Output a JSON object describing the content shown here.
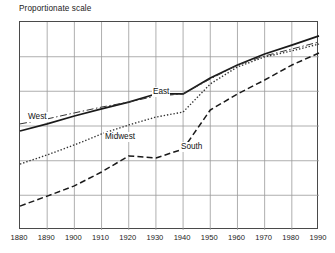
{
  "chart_data": {
    "type": "line",
    "title": "Proportionate scale",
    "xlabel": "",
    "ylabel": "",
    "grid": true,
    "legend_position": "inline-labels",
    "x_tick_labels": [
      "1880",
      "1890",
      "1900",
      "1910",
      "1920",
      "1930",
      "1940",
      "1950",
      "1960",
      "1970",
      "1980",
      "1990"
    ],
    "x": [
      1880,
      1890,
      1900,
      1910,
      1920,
      1930,
      1940,
      1950,
      1960,
      1970,
      1980,
      1990
    ],
    "xlim": [
      1880,
      1990
    ],
    "y_tick_labels": [],
    "ylim": [
      0,
      100
    ],
    "y_gridline_values": [
      100,
      83.3,
      66.7,
      50,
      33.3,
      16.7,
      0
    ],
    "series": [
      {
        "name": "East",
        "line_style": "solid",
        "color": "#1a1a1a",
        "values": [
          47.6,
          51.0,
          54.8,
          58.2,
          61.5,
          65.4,
          65.4,
          73.1,
          79.3,
          84.6,
          88.9,
          93.3
        ]
      },
      {
        "name": "West",
        "line_style": "dash-dot",
        "color": "#333333",
        "values": [
          51.0,
          53.4,
          56.3,
          59.1,
          61.5,
          64.4,
          65.4,
          72.6,
          79.3,
          83.7,
          87.0,
          90.4
        ]
      },
      {
        "name": "Midwest",
        "line_style": "dotted",
        "color": "#333333",
        "values": [
          31.7,
          36.1,
          40.9,
          46.2,
          50.5,
          54.3,
          56.7,
          70.2,
          78.4,
          83.2,
          86.1,
          89.4
        ]
      },
      {
        "name": "South",
        "line_style": "dashed",
        "color": "#1a1a1a",
        "values": [
          11.5,
          16.3,
          21.2,
          27.9,
          35.6,
          34.6,
          38.9,
          57.7,
          65.4,
          72.1,
          79.3,
          85.1
        ]
      }
    ],
    "annotations": [
      {
        "text": "West",
        "series": "West"
      },
      {
        "text": "East",
        "series": "East"
      },
      {
        "text": "Midwest",
        "series": "Midwest"
      },
      {
        "text": "South",
        "series": "South"
      }
    ]
  },
  "colors": {
    "frame": "#4a4a4a",
    "gridline": "#9a9a9a",
    "text": "#1a1a1a",
    "background": "#ffffff"
  }
}
